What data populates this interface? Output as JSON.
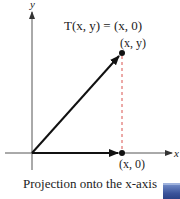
{
  "diagram": {
    "title_formula": "T(x, y) = (x, 0)",
    "axis_labels": {
      "x": "x",
      "y": "y"
    },
    "points": [
      {
        "label": "(x, y)",
        "px": 122,
        "py": 53
      },
      {
        "label": "(x, 0)",
        "px": 122,
        "py": 153
      }
    ],
    "caption": "Projection onto the x-axis",
    "colors": {
      "vector": "#1a1a1a",
      "dashed_line": "#d9534f",
      "nav_button": "#3b539a"
    }
  },
  "nav": {
    "button_icon": "next-slide-icon"
  }
}
